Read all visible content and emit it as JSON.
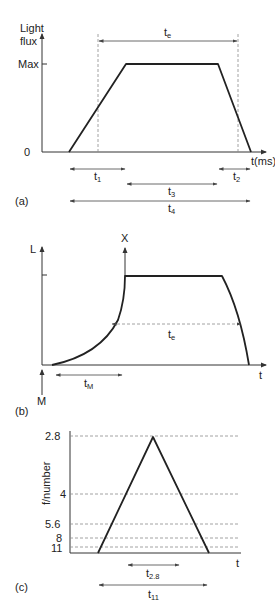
{
  "panels": {
    "a": {
      "label": "(a)",
      "y_axis_label_line1": "Light",
      "y_axis_label_line2": "flux",
      "y_tick_max": "Max",
      "y_tick_zero": "0",
      "x_axis_label": "t(ms)",
      "te_main": "t",
      "te_sub": "e",
      "t1_main": "t",
      "t1_sub": "1",
      "t2_main": "t",
      "t2_sub": "2",
      "t3_main": "t",
      "t3_sub": "3",
      "t4_main": "t",
      "t4_sub": "4"
    },
    "b": {
      "label": "(b)",
      "y_axis_label": "L",
      "x_axis_label": "t",
      "marker_x": "X",
      "marker_m": "M",
      "te_main": "t",
      "te_sub": "e",
      "tm_main": "t",
      "tm_sub": "M"
    },
    "c": {
      "label": "(c)",
      "y_axis_label": "f/number",
      "x_axis_label": "t",
      "y_ticks": [
        "2.8",
        "4",
        "5.6",
        "8",
        "11"
      ],
      "t28_main": "t",
      "t28_sub": "2.8",
      "t11_main": "t",
      "t11_sub": "11"
    }
  },
  "colors": {
    "line": "#222222",
    "dashed": "#8a8a8a",
    "background": "#ffffff"
  }
}
